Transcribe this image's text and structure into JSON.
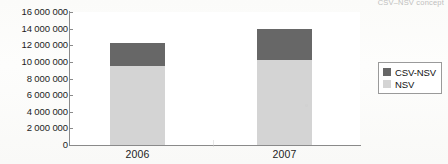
{
  "figure": {
    "clipped_header_text": "CSV–NSV concept",
    "background_color": "#fdfdfb"
  },
  "legend": {
    "position": "right",
    "border_color": "#9a9a9a",
    "entries": [
      {
        "label": "CSV-NSV",
        "color": "#676767"
      },
      {
        "label": "NSV",
        "color": "#d4d4d4"
      }
    ]
  },
  "axis": {
    "y_ticks": [
      "16 000 000",
      "14 000 000",
      "12 000 000",
      "10 000 000",
      "8 000 000",
      "6 000 000",
      "4 000 000",
      "2 000 000",
      "0"
    ],
    "x_ticks": [
      "2006",
      "2007"
    ]
  },
  "chart_data": {
    "type": "bar",
    "stacked": true,
    "title": "",
    "subtitle": "",
    "xlabel": "",
    "ylabel": "",
    "categories": [
      "2006",
      "2007"
    ],
    "series": [
      {
        "name": "NSV",
        "color": "#d4d4d4",
        "values": [
          9500000,
          10200000
        ]
      },
      {
        "name": "CSV-NSV",
        "color": "#676767",
        "values": [
          2800000,
          3800000
        ]
      }
    ],
    "totals": [
      12300000,
      14000000
    ],
    "ylim": [
      0,
      16000000
    ],
    "ytick_step": 2000000,
    "ytick_labels": [
      "0",
      "2 000 000",
      "4 000 000",
      "6 000 000",
      "8 000 000",
      "10 000 000",
      "12 000 000",
      "14 000 000",
      "16 000 000"
    ],
    "grid": false,
    "legend_position": "right"
  }
}
